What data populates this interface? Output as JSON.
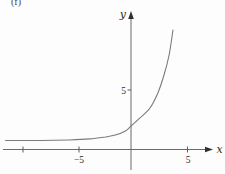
{
  "panel_label": "(f)",
  "colors": {
    "background": "#fdfdfd",
    "axis": "#6a6a6a",
    "curve": "#7b7b7b",
    "text": "#2b2b2b"
  },
  "chart_data": {
    "type": "line",
    "title": "",
    "xlabel": "x",
    "ylabel": "y",
    "grid": false,
    "legend": "none",
    "xlim": [
      -11.5,
      7.3
    ],
    "ylim": [
      -1.8,
      11.9
    ],
    "x_ticks": [
      -10,
      -5,
      5
    ],
    "x_tick_labels": [
      "",
      "−5",
      "5"
    ],
    "y_ticks": [
      5
    ],
    "y_tick_labels": [
      "5"
    ],
    "series": [
      {
        "name": "exponential-curve",
        "description": "exponential growth curve, flat near y=1 on the left, y-intercept 2, rising steeply",
        "points": [
          [
            -11.2,
            0.78
          ],
          [
            -8.0,
            0.78
          ],
          [
            -5.5,
            0.82
          ],
          [
            -3.7,
            0.91
          ],
          [
            -2.3,
            1.08
          ],
          [
            -1.4,
            1.25
          ],
          [
            -0.5,
            1.6
          ],
          [
            0.0,
            2.03
          ],
          [
            0.8,
            2.72
          ],
          [
            1.7,
            3.58
          ],
          [
            2.4,
            4.87
          ],
          [
            2.95,
            6.42
          ],
          [
            3.4,
            8.15
          ],
          [
            3.75,
            10.3
          ]
        ]
      }
    ]
  }
}
